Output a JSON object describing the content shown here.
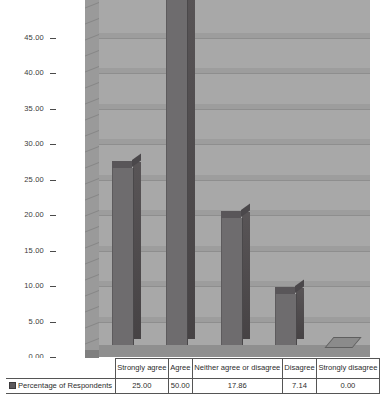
{
  "chart_data": {
    "type": "bar",
    "title": "",
    "xlabel": "",
    "ylabel": "",
    "categories": [
      "Strongly agree",
      "Agree",
      "Neither agree or disagree",
      "Disagree",
      "Strongly disagree"
    ],
    "series": [
      {
        "name": "Percentage of Respondents",
        "values": [
          25.0,
          50.0,
          17.86,
          7.14,
          0.0
        ]
      }
    ],
    "value_labels": [
      "25.00",
      "50.00",
      "17.86",
      "7.14",
      "0.00"
    ],
    "ylim": [
      0,
      50
    ],
    "ytick_labels": [
      "0.00",
      "5.00",
      "10.00",
      "15.00",
      "20.00",
      "25.00",
      "30.00",
      "35.00",
      "40.00",
      "45.00"
    ],
    "ytick_values": [
      0,
      5,
      10,
      15,
      20,
      25,
      30,
      35,
      40,
      45
    ],
    "grid": true,
    "legend_position": "table-row",
    "style": "3d-bar",
    "colors": {
      "plot_background": "#a8a8a8",
      "bar_front": "#6e6c6e",
      "bar_side": "#4e4a4c",
      "bar_top": "#595659",
      "gridline": "#8e8e8e",
      "floor": "#8f8f8f",
      "page_background": "#ffffff",
      "text": "#2d2d2d"
    }
  },
  "table": {
    "legend_label": "Percentage of Respondents",
    "headers": [
      "Strongly agree",
      "Agree",
      "Neither agree or disagree",
      "Disagree",
      "Strongly disagree"
    ],
    "row_values": [
      "25.00",
      "50.00",
      "17.86",
      "7.14",
      "0.00"
    ]
  }
}
